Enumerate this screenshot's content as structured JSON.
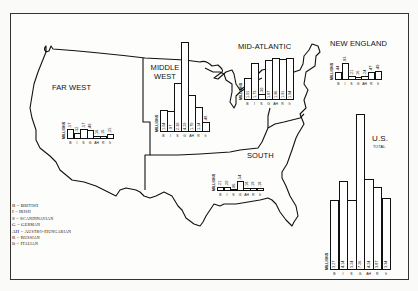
{
  "legend": [
    {
      "code": "B",
      "name": "British"
    },
    {
      "code": "I",
      "name": "Irish"
    },
    {
      "code": "S",
      "name": "Scandinavian"
    },
    {
      "code": "G",
      "name": "German"
    },
    {
      "code": "AH",
      "name": "Austro-Hungarian"
    },
    {
      "code": "R",
      "name": "Russian"
    },
    {
      "code": "It",
      "name": "Italian"
    }
  ],
  "chart_data": [
    {
      "type": "bar",
      "title": "FAR WEST",
      "ylabel": "MILLIONS",
      "categories": [
        "B",
        "I",
        "S",
        "G",
        "AH",
        "R",
        "It"
      ],
      "values": [
        0.57,
        0.32,
        0.57,
        0.49,
        0.16,
        0.16,
        0.25
      ],
      "labels": [
        ".57",
        ".32",
        ".57",
        ".49",
        ".16",
        ".16",
        ".25"
      ]
    },
    {
      "type": "bar",
      "title": "MIDDLE WEST",
      "ylabel": "MILLIONS",
      "categories": [
        "B",
        "I",
        "S",
        "G",
        "AH",
        "R",
        "It"
      ],
      "values": [
        1.04,
        0.97,
        2.3,
        4.2,
        1.7,
        1.14,
        0.48
      ],
      "labels": [
        "1.04",
        ".97",
        "2.30",
        "4.20",
        "1.70",
        "1.14",
        ".48"
      ]
    },
    {
      "type": "bar",
      "title": "MID-ATLANTIC",
      "ylabel": "MILLIONS",
      "categories": [
        "B",
        "I",
        "S",
        "G",
        "AH",
        "R",
        "It"
      ],
      "values": [
        1.01,
        1.73,
        0.3,
        1.87,
        1.96,
        1.91,
        1.94
      ],
      "labels": [
        "1.01",
        "1.73",
        ".30",
        "1.87",
        "1.96",
        "1.91",
        "1.94"
      ]
    },
    {
      "type": "bar",
      "title": "NEW ENGLAND",
      "ylabel": "MILLIONS",
      "categories": [
        "B",
        "I",
        "S",
        "G",
        "AH",
        "R",
        "It"
      ],
      "values": [
        0.44,
        0.93,
        0.21,
        0.16,
        0.24,
        0.47,
        0.49
      ],
      "labels": [
        ".44",
        ".93",
        ".21",
        ".16",
        ".24",
        ".47",
        ".49"
      ]
    },
    {
      "type": "bar",
      "title": "SOUTH",
      "ylabel": "MILLIONS",
      "categories": [
        "B",
        "I",
        "S",
        "G",
        "AH",
        "R",
        "It"
      ],
      "values": [
        0.21,
        0.2,
        0.06,
        0.54,
        0.18,
        0.19,
        0.18
      ],
      "labels": [
        ".21",
        ".20",
        ".06",
        ".54",
        ".18",
        ".19",
        ".18"
      ]
    },
    {
      "type": "bar",
      "title": "U.S.",
      "subtitle": "TOTAL",
      "ylabel": "MILLIONS",
      "categories": [
        "B",
        "I",
        "S",
        "G",
        "AH",
        "R",
        "It"
      ],
      "values": [
        3.27,
        4.14,
        3.24,
        7.26,
        4.24,
        3.87,
        3.34
      ],
      "labels": [
        "3.27",
        "4.14",
        "3.24",
        "7.26",
        "4.24",
        "3.87",
        "3.34"
      ]
    }
  ],
  "layout": {
    "charts": [
      {
        "x": 67,
        "y": 139,
        "bw": 6.6,
        "scale": 18,
        "labelInside": false
      },
      {
        "x": 160,
        "y": 132,
        "bw": 7.0,
        "scale": 21.5,
        "labelInside": true
      },
      {
        "x": 244,
        "y": 100,
        "bw": 7.0,
        "scale": 21.5,
        "labelInside": true
      },
      {
        "x": 335,
        "y": 80,
        "bw": 6.6,
        "scale": 18,
        "labelInside": false
      },
      {
        "x": 217,
        "y": 191,
        "bw": 6.6,
        "scale": 18,
        "labelInside": false
      },
      {
        "x": 330,
        "y": 270,
        "bw": 8.6,
        "scale": 21.5,
        "labelInside": true
      }
    ]
  }
}
